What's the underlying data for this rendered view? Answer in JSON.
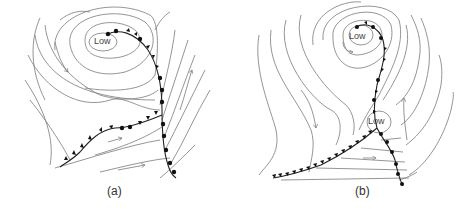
{
  "figure": {
    "panels": [
      {
        "id": "a",
        "caption": "(a)",
        "lows": [
          {
            "label": "Low"
          }
        ],
        "description": "Occluding mid-latitude cyclone: low pressure center with curved isobars, cold front (triangles) and warm front (semicircles) meeting; wind arrows along isobars"
      },
      {
        "id": "b",
        "caption": "(b)",
        "lows": [
          {
            "label": "Low"
          },
          {
            "label": "Low"
          }
        ],
        "description": "Secondary low forming at triple point: occluded front from primary low extends to a second low, with cold front trailing southwest and warm front south"
      }
    ],
    "colors": {
      "isobar": "#7a7a7a",
      "front": "#222222",
      "background": "#ffffff"
    },
    "legend_symbols": {
      "cold_front": "triangles",
      "warm_front": "semicircles",
      "occluded_front": "alternating triangles and semicircles"
    }
  }
}
